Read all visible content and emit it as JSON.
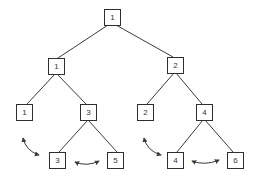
{
  "diagram": {
    "type": "binary-tree",
    "colors": {
      "line": "#3a3a3a",
      "node_border": "#2e2e2e",
      "text": "#333333",
      "background": "#ffffff"
    },
    "nodes": [
      {
        "id": "n0",
        "label": "1",
        "level": 0,
        "cx": 112,
        "cy": 17
      },
      {
        "id": "n1",
        "label": "1",
        "level": 1,
        "cx": 56,
        "cy": 66
      },
      {
        "id": "n2",
        "label": "2",
        "level": 1,
        "cx": 175,
        "cy": 65
      },
      {
        "id": "n3",
        "label": "1",
        "level": 2,
        "cx": 24,
        "cy": 112
      },
      {
        "id": "n4",
        "label": "3",
        "level": 2,
        "cx": 88,
        "cy": 112
      },
      {
        "id": "n5",
        "label": "2",
        "level": 2,
        "cx": 145,
        "cy": 112
      },
      {
        "id": "n6",
        "label": "4",
        "level": 2,
        "cx": 204,
        "cy": 112
      },
      {
        "id": "n7",
        "label": "3",
        "level": 3,
        "cx": 57,
        "cy": 160
      },
      {
        "id": "n8",
        "label": "5",
        "level": 3,
        "cx": 115,
        "cy": 160
      },
      {
        "id": "n9",
        "label": "4",
        "level": 3,
        "cx": 175,
        "cy": 160
      },
      {
        "id": "n10",
        "label": "6",
        "level": 3,
        "cx": 235,
        "cy": 160
      }
    ],
    "edges": [
      {
        "from": "n0",
        "to": "n1"
      },
      {
        "from": "n0",
        "to": "n2"
      },
      {
        "from": "n1",
        "to": "n3"
      },
      {
        "from": "n1",
        "to": "n4"
      },
      {
        "from": "n2",
        "to": "n5"
      },
      {
        "from": "n2",
        "to": "n6"
      },
      {
        "from": "n4",
        "to": "n7"
      },
      {
        "from": "n4",
        "to": "n8"
      },
      {
        "from": "n6",
        "to": "n9"
      },
      {
        "from": "n6",
        "to": "n10"
      }
    ],
    "swap_arrows": [
      {
        "id": "a1",
        "between": [
          "n3",
          "n7"
        ],
        "style": "double-headed-curved"
      },
      {
        "id": "a2",
        "between": [
          "n7",
          "n8"
        ],
        "style": "double-headed-curved"
      },
      {
        "id": "a3",
        "between": [
          "n5",
          "n9"
        ],
        "style": "double-headed-curved"
      },
      {
        "id": "a4",
        "between": [
          "n9",
          "n10"
        ],
        "style": "double-headed-curved"
      }
    ]
  }
}
